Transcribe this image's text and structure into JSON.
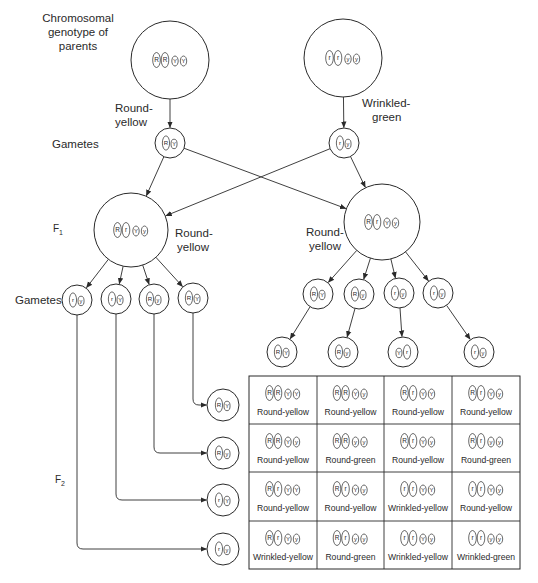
{
  "labels": {
    "parents": "Chromosomal genotype of parents",
    "parents_line1": "Chromosomal",
    "parents_line2": "genotype of",
    "parents_line3": "parents",
    "gametes_top": "Gametes",
    "f1": "F",
    "f1_sub": "1",
    "gametes_mid": "Gametes",
    "f2": "F",
    "f2_sub": "2"
  },
  "parents": [
    {
      "id": "parent-left",
      "phenotype_line1": "Round-",
      "phenotype_line2": "yellow",
      "alleles": [
        "R",
        "R",
        "Y",
        "Y"
      ],
      "cx": 170,
      "cy": 60,
      "r": 39
    },
    {
      "id": "parent-right",
      "phenotype_line1": "Wrinkled-",
      "phenotype_line2": "green",
      "alleles": [
        "r",
        "r",
        "y",
        "y"
      ],
      "cx": 343,
      "cy": 58,
      "r": 39
    }
  ],
  "parent_gametes": [
    {
      "alleles": [
        "R",
        "Y"
      ],
      "cx": 170,
      "cy": 143,
      "r": 15
    },
    {
      "alleles": [
        "r",
        "y"
      ],
      "cx": 344,
      "cy": 143,
      "r": 15
    }
  ],
  "f1": [
    {
      "id": "f1-left",
      "phenotype_line1": "Round-",
      "phenotype_line2": "yellow",
      "alleles": [
        "R",
        "r",
        "Y",
        "y"
      ],
      "cx": 131,
      "cy": 230,
      "r": 37
    },
    {
      "id": "f1-right",
      "phenotype_line1": "Round-",
      "phenotype_line2": "yellow",
      "alleles": [
        "R",
        "r",
        "Y",
        "y"
      ],
      "cx": 382,
      "cy": 222,
      "r": 38
    }
  ],
  "f1_left_gametes": [
    {
      "alleles": [
        "r",
        "y"
      ],
      "cx": 77,
      "cy": 300,
      "r": 15
    },
    {
      "alleles": [
        "r",
        "Y"
      ],
      "cx": 116,
      "cy": 299,
      "r": 15
    },
    {
      "alleles": [
        "R",
        "y"
      ],
      "cx": 154,
      "cy": 299,
      "r": 15
    },
    {
      "alleles": [
        "R",
        "Y"
      ],
      "cx": 193,
      "cy": 298,
      "r": 15
    }
  ],
  "f1_right_gametes": [
    {
      "alleles": [
        "R",
        "Y"
      ],
      "cx": 318,
      "cy": 294,
      "r": 15
    },
    {
      "alleles": [
        "R",
        "y"
      ],
      "cx": 359,
      "cy": 294,
      "r": 15
    },
    {
      "alleles": [
        "r",
        "y"
      ],
      "cx": 399,
      "cy": 293,
      "r": 15
    },
    {
      "alleles": [
        "r",
        "y"
      ],
      "cx": 438,
      "cy": 293,
      "r": 15
    }
  ],
  "punnett_column_gametes": [
    {
      "alleles": [
        "R",
        "Y"
      ],
      "cx": 282,
      "cy": 352,
      "r": 15
    },
    {
      "alleles": [
        "R",
        "y"
      ],
      "cx": 343,
      "cy": 352,
      "r": 15
    },
    {
      "alleles": [
        "Y",
        "r"
      ],
      "cx": 403,
      "cy": 352,
      "r": 15
    },
    {
      "alleles": [
        "r",
        "y"
      ],
      "cx": 479,
      "cy": 352,
      "r": 15
    }
  ],
  "punnett_row_gametes": [
    {
      "alleles": [
        "R",
        "Y"
      ],
      "cx": 223,
      "cy": 405,
      "r": 16
    },
    {
      "alleles": [
        "R",
        "y"
      ],
      "cx": 223,
      "cy": 453,
      "r": 16
    },
    {
      "alleles": [
        "r",
        "Y"
      ],
      "cx": 223,
      "cy": 500,
      "r": 16
    },
    {
      "alleles": [
        "r",
        "y"
      ],
      "cx": 223,
      "cy": 549,
      "r": 16
    }
  ],
  "punnett_grid": {
    "x": 249,
    "y": 376,
    "width": 271,
    "height": 193,
    "col_edges": [
      249,
      317,
      384,
      452,
      520
    ],
    "row_edges": [
      376,
      424,
      472,
      521,
      569
    ],
    "rows": [
      [
        {
          "genotype": [
            "R",
            "R",
            "Y",
            "Y"
          ],
          "phenotype": "Round-yellow"
        },
        {
          "genotype": [
            "R",
            "R",
            "Y",
            "y"
          ],
          "phenotype": "Round-yellow"
        },
        {
          "genotype": [
            "R",
            "r",
            "Y",
            "Y"
          ],
          "phenotype": "Round-yellow"
        },
        {
          "genotype": [
            "R",
            "r",
            "Y",
            "y"
          ],
          "phenotype": "Round-yellow"
        }
      ],
      [
        {
          "genotype": [
            "R",
            "R",
            "Y",
            "y"
          ],
          "phenotype": "Round-yellow"
        },
        {
          "genotype": [
            "R",
            "R",
            "y",
            "y"
          ],
          "phenotype": "Round-green"
        },
        {
          "genotype": [
            "R",
            "r",
            "Y",
            "y"
          ],
          "phenotype": "Round-yellow"
        },
        {
          "genotype": [
            "R",
            "r",
            "y",
            "y"
          ],
          "phenotype": "Round-green"
        }
      ],
      [
        {
          "genotype": [
            "R",
            "r",
            "Y",
            "Y"
          ],
          "phenotype": "Round-yellow"
        },
        {
          "genotype": [
            "R",
            "r",
            "Y",
            "y"
          ],
          "phenotype": "Round-yellow"
        },
        {
          "genotype": [
            "r",
            "r",
            "Y",
            "Y"
          ],
          "phenotype": "Wrinkled-yellow"
        },
        {
          "genotype": [
            "r",
            "r",
            "Y",
            "y"
          ],
          "phenotype": "Round-yellow"
        }
      ],
      [
        {
          "genotype": [
            "R",
            "r",
            "Y",
            "y"
          ],
          "phenotype": "Wrinkled-yellow"
        },
        {
          "genotype": [
            "R",
            "r",
            "y",
            "y"
          ],
          "phenotype": "Round-green"
        },
        {
          "genotype": [
            "r",
            "r",
            "Y",
            "y"
          ],
          "phenotype": "Wrinkled-yellow"
        },
        {
          "genotype": [
            "r",
            "r",
            "y",
            "y"
          ],
          "phenotype": "Wrinkled-green"
        }
      ]
    ]
  },
  "colors": {
    "ink": "#2a2a2a",
    "background": "#ffffff"
  }
}
